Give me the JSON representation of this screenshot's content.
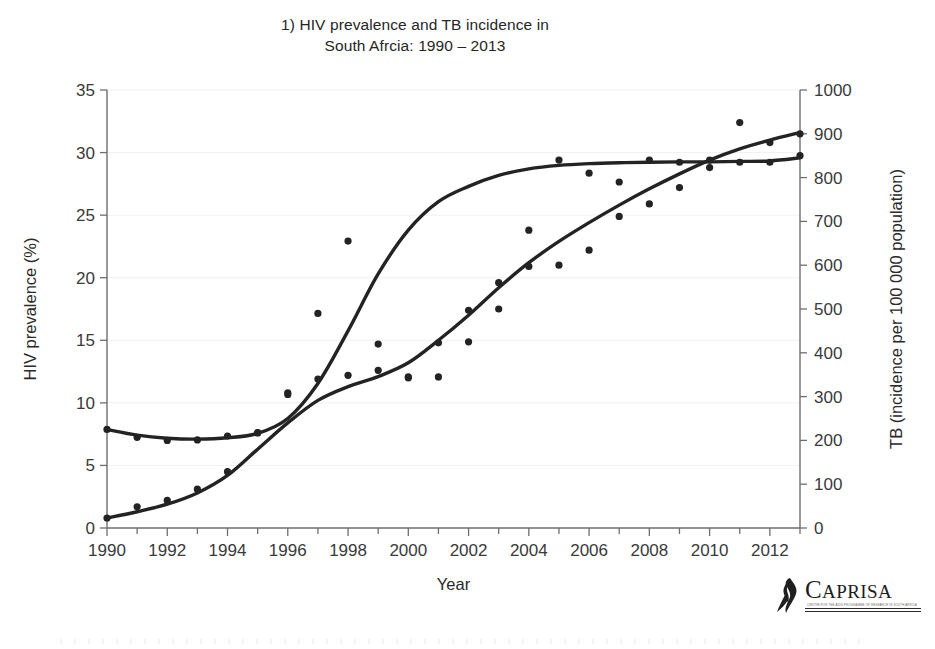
{
  "figure": {
    "title": "1) HIV prevalence and TB incidence in\nSouth Afrcia: 1990 – 2013",
    "title_line1": "1) HIV prevalence and TB incidence in",
    "title_line2": "South Afrcia: 1990 – 2013"
  },
  "logo": {
    "name": "CAPRISA",
    "word_cap": "C",
    "word_rest": "APRISA",
    "icon": "awareness-ribbon-icon",
    "tagline": "CENTRE FOR THE AIDS PROGRAMME OF RESEARCH IN SOUTH AFRICA"
  },
  "colors": {
    "series": "#232323",
    "axis": "#6e6e6e",
    "text": "#2a2a2a",
    "background": "#ffffff",
    "grid": "#f0f0f0"
  },
  "chart_data": {
    "type": "line",
    "title": "1) HIV prevalence and TB incidence in South Afrcia: 1990 – 2013",
    "xlabel": "Year",
    "ylabel": "HIV prevalence (%)",
    "y2label": "TB (incidence per 100 000 population)",
    "xlim": [
      1990,
      2013
    ],
    "ylim": [
      0,
      35
    ],
    "y2lim": [
      0,
      1000
    ],
    "xticks": [
      1990,
      1992,
      1994,
      1996,
      1998,
      2000,
      2002,
      2004,
      2006,
      2008,
      2010,
      2012
    ],
    "xticklabels": [
      "1990",
      "1992",
      "1994",
      "1996",
      "1998",
      "2000",
      "2002",
      "2004",
      "2006",
      "2008",
      "2010",
      "2012"
    ],
    "xminorticks": [
      1991,
      1993,
      1995,
      1997,
      1999,
      2001,
      2003,
      2005,
      2007,
      2009,
      2011,
      2013
    ],
    "yticks": [
      0,
      5,
      10,
      15,
      20,
      25,
      30,
      35
    ],
    "yticklabels": [
      "0",
      "5",
      "10",
      "15",
      "20",
      "25",
      "30",
      "35"
    ],
    "y2ticks": [
      0,
      100,
      200,
      300,
      400,
      500,
      600,
      700,
      800,
      900,
      1000
    ],
    "y2ticklabels": [
      "0",
      "100",
      "200",
      "300",
      "400",
      "500",
      "600",
      "700",
      "800",
      "900",
      "1000"
    ],
    "grid": false,
    "legend": null,
    "x": [
      1990,
      1991,
      1992,
      1993,
      1994,
      1995,
      1996,
      1997,
      1998,
      1999,
      2000,
      2001,
      2002,
      2003,
      2004,
      2005,
      2006,
      2007,
      2008,
      2009,
      2010,
      2011,
      2012,
      2013
    ],
    "series": [
      {
        "name": "HIV prevalence (%)",
        "axis": "left",
        "unit": "%",
        "marker": "dot",
        "scatter_values": [
          0.8,
          1.7,
          2.2,
          3.1,
          4.5,
          7.6,
          10.8,
          11.9,
          12.2,
          12.6,
          12.0,
          14.8,
          17.4,
          19.6,
          20.9,
          21.0,
          22.2,
          24.9,
          25.9,
          27.2,
          28.8,
          32.4,
          30.8,
          31.5
        ],
        "fit_values": [
          0.8,
          1.3,
          1.9,
          2.8,
          4.2,
          6.3,
          8.4,
          10.2,
          11.3,
          12.1,
          13.2,
          15.0,
          17.0,
          19.2,
          21.2,
          22.9,
          24.4,
          25.8,
          27.1,
          28.3,
          29.4,
          30.3,
          31.0,
          31.6
        ]
      },
      {
        "name": "TB incidence (per 100 000 population)",
        "axis": "right",
        "unit": "per 100 000",
        "marker": "dot",
        "scatter_values": [
          225,
          207,
          200,
          201,
          210,
          218,
          305,
          490,
          655,
          420,
          345,
          345,
          425,
          500,
          680,
          840,
          810,
          790,
          840,
          835,
          840,
          835,
          835,
          850
        ],
        "fit_values": [
          225,
          212,
          205,
          203,
          206,
          216,
          250,
          330,
          450,
          580,
          680,
          745,
          780,
          805,
          820,
          828,
          832,
          834,
          835,
          836,
          836,
          837,
          838,
          845
        ]
      }
    ]
  }
}
